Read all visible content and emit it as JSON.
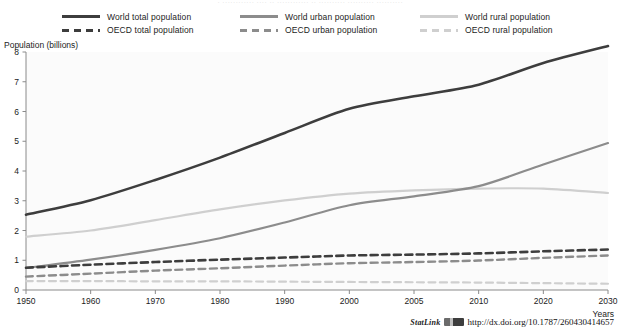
{
  "figure": {
    "top_fragment": "· ············ ···· ·· ············ ·· ·········· ·········· ··········",
    "background_color": "#ffffff",
    "plot_background_color": "#fbfbfb"
  },
  "legend": {
    "columns": [
      {
        "entries": [
          {
            "label": "World total population",
            "style": "solid",
            "color": "#3d3d3d",
            "name": "world-total-population"
          },
          {
            "label": "OECD total population",
            "style": "dashed",
            "color": "#3d3d3d",
            "name": "oecd-total-population"
          }
        ]
      },
      {
        "entries": [
          {
            "label": "World urban population",
            "style": "solid",
            "color": "#8c8c8c",
            "name": "world-urban-population"
          },
          {
            "label": "OECD urban population",
            "style": "dashed",
            "color": "#8c8c8c",
            "name": "oecd-urban-population"
          }
        ]
      },
      {
        "entries": [
          {
            "label": "World rural population",
            "style": "solid",
            "color": "#cfcfcf",
            "name": "world-rural-population"
          },
          {
            "label": "OECD rural population",
            "style": "dashed",
            "color": "#cfcfcf",
            "name": "oecd-rural-population"
          }
        ]
      }
    ]
  },
  "footer": {
    "statlink_word": "StatLink",
    "statlink_url": "http://dx.doi.org/10.1787/260430414657"
  },
  "chart_data": {
    "type": "line",
    "title": "",
    "xlabel": "Years",
    "ylabel": "Population (billions)",
    "ylim": [
      0,
      8
    ],
    "yticks": [
      0,
      1,
      2,
      3,
      4,
      5,
      6,
      7,
      8
    ],
    "categories": [
      "1950",
      "1960",
      "1970",
      "1980",
      "1990",
      "2000",
      "2005",
      "2010",
      "2020",
      "2030"
    ],
    "grid": false,
    "legend_position": "top",
    "series": [
      {
        "name": "World total population",
        "style": "solid",
        "color": "#3d3d3d",
        "width": 2.6,
        "values": [
          2.53,
          3.02,
          3.7,
          4.45,
          5.28,
          6.09,
          6.51,
          6.9,
          7.63,
          8.2
        ]
      },
      {
        "name": "World urban population",
        "style": "solid",
        "color": "#8c8c8c",
        "width": 2.2,
        "values": [
          0.74,
          1.02,
          1.35,
          1.74,
          2.27,
          2.85,
          3.15,
          3.49,
          4.22,
          4.94
        ]
      },
      {
        "name": "World rural population",
        "style": "solid",
        "color": "#cfcfcf",
        "width": 2.2,
        "values": [
          1.79,
          2.0,
          2.35,
          2.71,
          3.01,
          3.24,
          3.35,
          3.41,
          3.41,
          3.26
        ]
      },
      {
        "name": "OECD total population",
        "style": "dashed",
        "color": "#3d3d3d",
        "width": 2.6,
        "values": [
          0.75,
          0.85,
          0.94,
          1.02,
          1.09,
          1.16,
          1.19,
          1.23,
          1.3,
          1.36
        ]
      },
      {
        "name": "OECD urban population",
        "style": "dashed",
        "color": "#8c8c8c",
        "width": 2.4,
        "values": [
          0.45,
          0.55,
          0.65,
          0.73,
          0.82,
          0.9,
          0.94,
          0.99,
          1.08,
          1.16
        ]
      },
      {
        "name": "OECD rural population",
        "style": "dashed",
        "color": "#cfcfcf",
        "width": 2.2,
        "values": [
          0.3,
          0.3,
          0.29,
          0.29,
          0.28,
          0.27,
          0.26,
          0.25,
          0.23,
          0.21
        ]
      }
    ],
    "annotations": [
      {
        "text": "World urban population overtakes World rural population around 2008 at about 3.35 billion"
      }
    ]
  }
}
